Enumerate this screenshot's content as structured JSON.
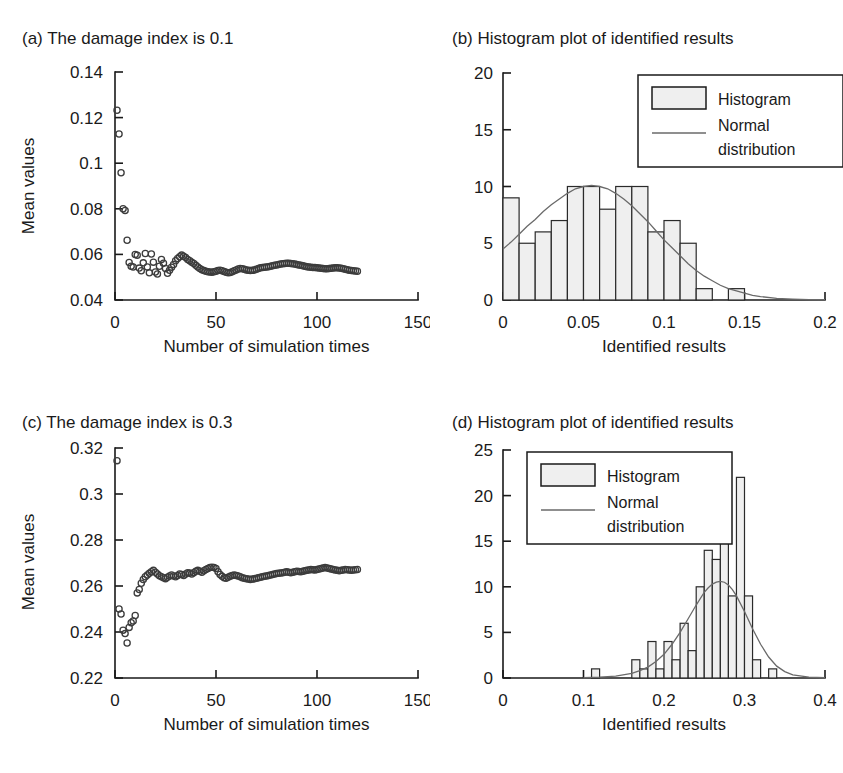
{
  "figure": {
    "caption_a": "(a) The damage index is 0.1",
    "caption_b": "(b) Histogram plot of identified results",
    "caption_c": "(c) The damage index is 0.3",
    "caption_d": "(d) Histogram plot of identified results",
    "colors": {
      "ink": "#1a1a1a",
      "bar_fill": "#efefef",
      "bar_stroke": "#2a2a2a",
      "curve": "#6a6a6a",
      "marker": "#3c3c3c",
      "background": "#ffffff"
    }
  },
  "chart_data": [
    {
      "id": "a",
      "type": "scatter",
      "title": "(a) The damage index is 0.1",
      "xlabel": "Number of simulation times",
      "ylabel": "Mean values",
      "xlim": [
        0,
        150
      ],
      "ylim": [
        0.04,
        0.14
      ],
      "xticks": [
        0,
        50,
        100,
        150
      ],
      "xticklabels": [
        "0",
        "50",
        "100",
        "150"
      ],
      "yticks": [
        0.04,
        0.06,
        0.08,
        0.1,
        0.12,
        0.14
      ],
      "yticklabels": [
        "0.04",
        "0.06",
        "0.08",
        "0.1",
        "0.12",
        "0.14"
      ],
      "grid": false,
      "legend": null,
      "marker": "open-circle",
      "x": [
        1,
        2,
        3,
        4,
        5,
        6,
        7,
        8,
        9,
        10,
        11,
        12,
        13,
        14,
        15,
        16,
        17,
        18,
        19,
        20,
        21,
        22,
        23,
        24,
        25,
        26,
        27,
        28,
        29,
        30,
        31,
        32,
        33,
        34,
        35,
        36,
        37,
        38,
        39,
        40,
        41,
        42,
        43,
        44,
        45,
        46,
        47,
        48,
        49,
        50,
        51,
        52,
        53,
        54,
        55,
        56,
        57,
        58,
        59,
        60,
        61,
        62,
        63,
        64,
        65,
        66,
        67,
        68,
        69,
        70,
        71,
        72,
        73,
        74,
        75,
        76,
        77,
        78,
        79,
        80,
        81,
        82,
        83,
        84,
        85,
        86,
        87,
        88,
        89,
        90,
        91,
        92,
        93,
        94,
        95,
        96,
        97,
        98,
        99,
        100,
        101,
        102,
        103,
        104,
        105,
        106,
        107,
        108,
        109,
        110,
        111,
        112,
        113,
        114,
        115,
        116,
        117,
        118,
        119,
        120
      ],
      "y": [
        0.1232,
        0.1128,
        0.0958,
        0.08,
        0.0793,
        0.0662,
        0.0565,
        0.0548,
        0.0545,
        0.06,
        0.0596,
        0.054,
        0.0528,
        0.0563,
        0.0604,
        0.0545,
        0.0519,
        0.0602,
        0.0566,
        0.0523,
        0.0514,
        0.0548,
        0.0578,
        0.0561,
        0.0538,
        0.0517,
        0.053,
        0.0544,
        0.0556,
        0.0572,
        0.0582,
        0.059,
        0.0597,
        0.0592,
        0.0586,
        0.0578,
        0.0572,
        0.0566,
        0.056,
        0.0552,
        0.0545,
        0.0538,
        0.0533,
        0.0529,
        0.0526,
        0.0524,
        0.0523,
        0.0522,
        0.0524,
        0.0526,
        0.0529,
        0.0531,
        0.0528,
        0.0525,
        0.0522,
        0.052,
        0.0521,
        0.0524,
        0.0528,
        0.0532,
        0.0536,
        0.0538,
        0.0537,
        0.0535,
        0.0532,
        0.053,
        0.0529,
        0.053,
        0.0532,
        0.0535,
        0.0538,
        0.0541,
        0.0543,
        0.0544,
        0.0545,
        0.0546,
        0.0548,
        0.055,
        0.0552,
        0.0554,
        0.0556,
        0.0558,
        0.0559,
        0.056,
        0.0561,
        0.0561,
        0.056,
        0.0559,
        0.0558,
        0.0556,
        0.0554,
        0.0552,
        0.055,
        0.0548,
        0.0546,
        0.0545,
        0.0544,
        0.0543,
        0.0542,
        0.0541,
        0.054,
        0.0539,
        0.0538,
        0.0537,
        0.0537,
        0.0538,
        0.0539,
        0.054,
        0.0541,
        0.0541,
        0.054,
        0.0539,
        0.0537,
        0.0535,
        0.0533,
        0.0531,
        0.0529,
        0.0528,
        0.0527,
        0.0526,
        0.0525
      ]
    },
    {
      "id": "b",
      "type": "bar",
      "title": "(b) Histogram plot of identified results",
      "xlabel": "Identified results",
      "ylabel": "",
      "xlim": [
        0,
        0.2
      ],
      "ylim": [
        0,
        20
      ],
      "xticks": [
        0,
        0.05,
        0.1,
        0.15,
        0.2
      ],
      "xticklabels": [
        "0",
        "0.05",
        "0.1",
        "0.15",
        "0.2"
      ],
      "yticks": [
        0,
        5,
        10,
        15,
        20
      ],
      "yticklabels": [
        "0",
        "5",
        "10",
        "15",
        "20"
      ],
      "grid": false,
      "legend": {
        "position": "top-right",
        "entries": [
          {
            "label": "Histogram",
            "swatch": "box"
          },
          {
            "label": "Normal distribution",
            "swatch": "line"
          }
        ]
      },
      "bin_edges": [
        0.0,
        0.01,
        0.02,
        0.03,
        0.04,
        0.05,
        0.06,
        0.07,
        0.08,
        0.09,
        0.1,
        0.11,
        0.12,
        0.13,
        0.14,
        0.15,
        0.16
      ],
      "bin_centers": [
        0.005,
        0.015,
        0.025,
        0.035,
        0.045,
        0.055,
        0.065,
        0.075,
        0.085,
        0.095,
        0.105,
        0.115,
        0.125,
        0.135,
        0.145,
        0.155
      ],
      "values": [
        9,
        5,
        6,
        7,
        10,
        10,
        8,
        10,
        10,
        6,
        7,
        5,
        1,
        0,
        1,
        0
      ],
      "normal_curve": {
        "label": "Normal distribution",
        "mean": 0.055,
        "std": 0.038,
        "peak_value": 10.1,
        "x": [
          0.0,
          0.005,
          0.01,
          0.015,
          0.02,
          0.025,
          0.03,
          0.035,
          0.04,
          0.045,
          0.05,
          0.055,
          0.06,
          0.065,
          0.07,
          0.075,
          0.08,
          0.085,
          0.09,
          0.095,
          0.1,
          0.105,
          0.11,
          0.115,
          0.12,
          0.125,
          0.13,
          0.135,
          0.14,
          0.145,
          0.15,
          0.155,
          0.16,
          0.17,
          0.18,
          0.19,
          0.2
        ],
        "y": [
          4.5,
          5.1,
          5.8,
          6.5,
          7.1,
          7.8,
          8.4,
          8.9,
          9.4,
          9.8,
          10.0,
          10.1,
          10.0,
          9.8,
          9.4,
          8.9,
          8.3,
          7.6,
          6.9,
          6.1,
          5.3,
          4.6,
          3.9,
          3.2,
          2.6,
          2.1,
          1.7,
          1.3,
          1.0,
          0.8,
          0.6,
          0.4,
          0.3,
          0.15,
          0.08,
          0.04,
          0.02
        ]
      }
    },
    {
      "id": "c",
      "type": "scatter",
      "title": "(c) The damage index is 0.3",
      "xlabel": "Number of simulation times",
      "ylabel": "Mean values",
      "xlim": [
        0,
        150
      ],
      "ylim": [
        0.22,
        0.32
      ],
      "xticks": [
        0,
        50,
        100,
        150
      ],
      "xticklabels": [
        "0",
        "50",
        "100",
        "150"
      ],
      "yticks": [
        0.22,
        0.24,
        0.26,
        0.28,
        0.3,
        0.32
      ],
      "yticklabels": [
        "0.22",
        "0.24",
        "0.26",
        "0.28",
        "0.3",
        "0.32"
      ],
      "grid": false,
      "legend": null,
      "marker": "open-circle",
      "x": [
        1,
        2,
        3,
        4,
        5,
        6,
        7,
        8,
        9,
        10,
        11,
        12,
        13,
        14,
        15,
        16,
        17,
        18,
        19,
        20,
        21,
        22,
        23,
        24,
        25,
        26,
        27,
        28,
        29,
        30,
        31,
        32,
        33,
        34,
        35,
        36,
        37,
        38,
        39,
        40,
        41,
        42,
        43,
        44,
        45,
        46,
        47,
        48,
        49,
        50,
        51,
        52,
        53,
        54,
        55,
        56,
        57,
        58,
        59,
        60,
        61,
        62,
        63,
        64,
        65,
        66,
        67,
        68,
        69,
        70,
        71,
        72,
        73,
        74,
        75,
        76,
        77,
        78,
        79,
        80,
        81,
        82,
        83,
        84,
        85,
        86,
        87,
        88,
        89,
        90,
        91,
        92,
        93,
        94,
        95,
        96,
        97,
        98,
        99,
        100,
        101,
        102,
        103,
        104,
        105,
        106,
        107,
        108,
        109,
        110,
        111,
        112,
        113,
        114,
        115,
        116,
        117,
        118,
        119,
        120
      ],
      "y": [
        0.3145,
        0.25,
        0.2478,
        0.2408,
        0.2393,
        0.2352,
        0.242,
        0.244,
        0.2448,
        0.2472,
        0.257,
        0.2585,
        0.2612,
        0.2628,
        0.264,
        0.2648,
        0.2655,
        0.2662,
        0.2668,
        0.266,
        0.2652,
        0.2645,
        0.264,
        0.2636,
        0.2632,
        0.2638,
        0.2644,
        0.2648,
        0.2644,
        0.264,
        0.2646,
        0.2652,
        0.265,
        0.2646,
        0.2652,
        0.2658,
        0.2656,
        0.2652,
        0.2658,
        0.2664,
        0.2668,
        0.2664,
        0.266,
        0.2666,
        0.2672,
        0.2676,
        0.268,
        0.2682,
        0.268,
        0.2676,
        0.2662,
        0.265,
        0.2642,
        0.2636,
        0.2634,
        0.2638,
        0.2642,
        0.2646,
        0.2648,
        0.2646,
        0.2644,
        0.264,
        0.2636,
        0.2634,
        0.2632,
        0.263,
        0.2628,
        0.263,
        0.2632,
        0.2634,
        0.2636,
        0.2638,
        0.264,
        0.2642,
        0.2644,
        0.2646,
        0.2648,
        0.265,
        0.2652,
        0.2654,
        0.2655,
        0.2656,
        0.2658,
        0.266,
        0.2662,
        0.266,
        0.2658,
        0.266,
        0.2662,
        0.2664,
        0.2663,
        0.2662,
        0.2664,
        0.2666,
        0.2668,
        0.267,
        0.2672,
        0.2671,
        0.267,
        0.2672,
        0.2674,
        0.2676,
        0.2678,
        0.268,
        0.2678,
        0.2676,
        0.2674,
        0.2672,
        0.267,
        0.2668,
        0.2666,
        0.2668,
        0.267,
        0.2672,
        0.2671,
        0.267,
        0.2669,
        0.267,
        0.2671,
        0.2672
      ]
    },
    {
      "id": "d",
      "type": "bar",
      "title": "(d) Histogram plot of identified results",
      "xlabel": "Identified results",
      "ylabel": "",
      "xlim": [
        0,
        0.4
      ],
      "ylim": [
        0,
        25
      ],
      "xticks": [
        0,
        0.1,
        0.2,
        0.3,
        0.4
      ],
      "xticklabels": [
        "0",
        "0.1",
        "0.2",
        "0.3",
        "0.4"
      ],
      "yticks": [
        0,
        5,
        10,
        15,
        20,
        25
      ],
      "yticklabels": [
        "0",
        "5",
        "10",
        "15",
        "20",
        "25"
      ],
      "grid": false,
      "legend": {
        "position": "top-left",
        "entries": [
          {
            "label": "Histogram",
            "swatch": "box"
          },
          {
            "label": "Normal distribution",
            "swatch": "line"
          }
        ]
      },
      "bin_edges": [
        0.1,
        0.11,
        0.12,
        0.13,
        0.14,
        0.15,
        0.16,
        0.17,
        0.18,
        0.19,
        0.2,
        0.21,
        0.22,
        0.23,
        0.24,
        0.25,
        0.26,
        0.27,
        0.28,
        0.29,
        0.3,
        0.31,
        0.32,
        0.33,
        0.34,
        0.35
      ],
      "bin_centers": [
        0.105,
        0.115,
        0.125,
        0.135,
        0.145,
        0.155,
        0.165,
        0.175,
        0.185,
        0.195,
        0.205,
        0.215,
        0.225,
        0.235,
        0.245,
        0.255,
        0.265,
        0.275,
        0.285,
        0.295,
        0.305,
        0.315,
        0.325,
        0.335,
        0.345
      ],
      "values": [
        0,
        1,
        0,
        0,
        0,
        0,
        2,
        1,
        4,
        1,
        4,
        2,
        6,
        3,
        10,
        14,
        13,
        15,
        9,
        22,
        9,
        2,
        0,
        1,
        0
      ],
      "normal_curve": {
        "label": "Normal distribution",
        "mean": 0.268,
        "std": 0.037,
        "peak_value": 10.6,
        "x": [
          0.1,
          0.12,
          0.14,
          0.16,
          0.17,
          0.18,
          0.19,
          0.2,
          0.21,
          0.22,
          0.23,
          0.24,
          0.25,
          0.255,
          0.26,
          0.265,
          0.27,
          0.275,
          0.28,
          0.285,
          0.29,
          0.3,
          0.31,
          0.32,
          0.33,
          0.34,
          0.35,
          0.36,
          0.38,
          0.4
        ],
        "y": [
          0.05,
          0.1,
          0.2,
          0.5,
          0.8,
          1.2,
          1.8,
          2.6,
          3.7,
          5.0,
          6.5,
          8.0,
          9.4,
          9.9,
          10.3,
          10.5,
          10.6,
          10.5,
          10.2,
          9.7,
          9.0,
          7.3,
          5.4,
          3.7,
          2.3,
          1.3,
          0.7,
          0.35,
          0.1,
          0.03
        ]
      }
    }
  ]
}
